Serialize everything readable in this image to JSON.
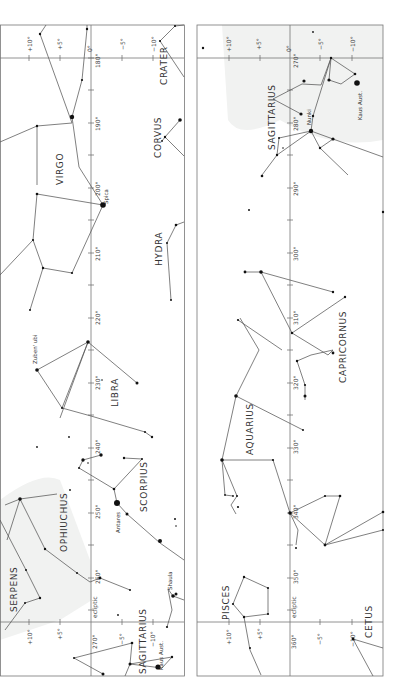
{
  "panels": [
    {
      "id": "left",
      "ecliptic_label": "ecliptic",
      "longitude_labels": [
        "180°",
        "190°",
        "200°",
        "210°",
        "220°",
        "230°",
        "240°",
        "250°",
        "260°",
        "270°"
      ],
      "declination_labels_top": [
        "+10°",
        "+5°",
        "0°",
        "−5°",
        "−10°"
      ],
      "declination_labels_bottom": [
        "+10°",
        "+5°",
        "0°",
        "−5°",
        "−10°"
      ],
      "constellations": [
        "VIRGO",
        "CRATER",
        "CORVUS",
        "HYDRA",
        "LIBRA",
        "SCORPIUS",
        "OPHIUCHUS",
        "SERPENS",
        "SAGITTARIUS"
      ],
      "stars": [
        "Spica",
        "Zuben'ubi",
        "Antares",
        "Shaula",
        "Kaus Aust."
      ]
    },
    {
      "id": "right",
      "ecliptic_label": "ecliptic",
      "longitude_labels": [
        "270°",
        "280°",
        "290°",
        "300°",
        "310°",
        "320°",
        "330°",
        "340°",
        "350°",
        "360°"
      ],
      "declination_labels_top": [
        "+10°",
        "+5°",
        "0°",
        "−5°",
        "−10°"
      ],
      "declination_labels_bottom": [
        "+10°",
        "+5°",
        "0°",
        "−5°",
        "−10°"
      ],
      "constellations": [
        "SAGITTARIUS",
        "CAPRICORNUS",
        "AQUARIUS",
        "PISCES",
        "CETUS"
      ],
      "stars": [
        "Nunki",
        "Kaus Aust."
      ]
    }
  ],
  "labels": {
    "virgo": "VIRGO",
    "crater": "CRATER",
    "corvus": "CORVUS",
    "hydra": "HYDRA",
    "libra": "LIBRA",
    "scorpius": "SCORPIUS",
    "ophiuchus": "OPHIUCHUS",
    "serpens": "SERPENS",
    "sagittarius": "SAGITTARIUS",
    "capricornus": "CAPRICORNUS",
    "aquarius": "AQUARIUS",
    "pisces": "PISCES",
    "cetus": "CETUS",
    "spica": "Spica",
    "zubenubi": "Zuben' ubi",
    "antares": "Antares",
    "shaula": "Shaula",
    "kaus_left": "Kaus Aust.",
    "kaus_right": "Kaus Aust.",
    "nunki": "Nunki",
    "ecliptic": "ecliptic",
    "lon_180": "180°",
    "lon_190": "190°",
    "lon_200": "200°",
    "lon_210": "210°",
    "lon_220": "220°",
    "lon_230": "230°",
    "lon_240": "240°",
    "lon_250": "250°",
    "lon_260": "260°",
    "lon_270": "270°",
    "lon_280": "280°",
    "lon_290": "290°",
    "lon_300": "300°",
    "lon_310": "310°",
    "lon_320": "320°",
    "lon_330": "330°",
    "lon_340": "340°",
    "lon_350": "350°",
    "lon_360": "360°",
    "dec_p10": "+10°",
    "dec_p5": "+5°",
    "dec_0": "0°",
    "dec_m5": "−5°",
    "dec_m10": "−10°"
  }
}
